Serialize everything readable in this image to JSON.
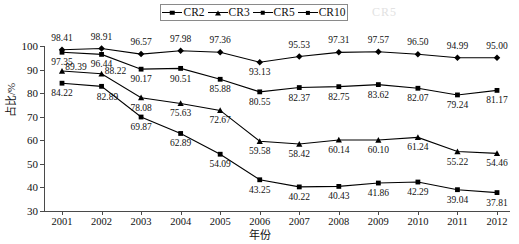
{
  "legend": {
    "position": "top-center",
    "items": [
      {
        "label": "CR2",
        "marker": "square",
        "color": "#000000"
      },
      {
        "label": "CR3",
        "marker": "triangle",
        "color": "#000000"
      },
      {
        "label": "CR5",
        "marker": "square",
        "color": "#000000"
      },
      {
        "label": "CR10",
        "marker": "diamond",
        "color": "#000000"
      }
    ]
  },
  "watermark": {
    "text": "CR5"
  },
  "axes": {
    "y_label": "占比/%",
    "x_label": "年份",
    "y_ticks": [
      30,
      40,
      50,
      60,
      70,
      80,
      90,
      100
    ],
    "x_ticks": [
      "2001",
      "2002",
      "2003",
      "2004",
      "2005",
      "2006",
      "2007",
      "2008",
      "2009",
      "2010",
      "2011",
      "2012"
    ]
  },
  "chart_data": {
    "type": "line",
    "title": "",
    "xlabel": "年份",
    "ylabel": "占比/%",
    "ylim": [
      30,
      100
    ],
    "grid": false,
    "legend_position": "top-center",
    "categories": [
      "2001",
      "2002",
      "2003",
      "2004",
      "2005",
      "2006",
      "2007",
      "2008",
      "2009",
      "2010",
      "2011",
      "2012"
    ],
    "series": [
      {
        "name": "CR2",
        "marker": "square",
        "color": "#000000",
        "values": [
          84.22,
          82.89,
          69.87,
          62.89,
          54.09,
          43.25,
          40.22,
          40.43,
          41.86,
          42.29,
          39.04,
          37.81
        ],
        "labels": [
          "84.22",
          "82.89",
          "69.87",
          "62.89",
          "54.09",
          "43.25",
          "40.22",
          "40.43",
          "41.86",
          "42.29",
          "39.04",
          "37.81"
        ]
      },
      {
        "name": "CR3",
        "marker": "triangle",
        "color": "#000000",
        "values": [
          89.39,
          88.22,
          78.08,
          75.63,
          72.67,
          59.58,
          58.42,
          60.14,
          60.1,
          61.24,
          55.22,
          54.46
        ],
        "labels": [
          "89.39",
          "88.22",
          "78.08",
          "75.63",
          "72.67",
          "59.58",
          "58.42",
          "60.14",
          "60.10",
          "61.24",
          "55.22",
          "54.46"
        ]
      },
      {
        "name": "CR5",
        "marker": "square",
        "color": "#000000",
        "values": [
          97.35,
          96.44,
          90.17,
          90.51,
          85.88,
          80.55,
          82.37,
          82.75,
          83.62,
          82.07,
          79.24,
          81.17
        ],
        "labels": [
          "97.35",
          "96.44",
          "90.17",
          "90.51",
          "85.88",
          "80.55",
          "82.37",
          "82.75",
          "83.62",
          "82.07",
          "79.24",
          "81.17"
        ]
      },
      {
        "name": "CR10",
        "marker": "diamond",
        "color": "#000000",
        "values": [
          98.41,
          98.91,
          96.57,
          97.98,
          97.36,
          93.13,
          95.53,
          97.31,
          97.57,
          96.5,
          94.99,
          95.0
        ],
        "labels": [
          "98.41",
          "98.91",
          "96.57",
          "97.98",
          "97.36",
          "93.13",
          "95.53",
          "97.31",
          "97.57",
          "96.50",
          "94.99",
          "95.00"
        ]
      }
    ]
  }
}
